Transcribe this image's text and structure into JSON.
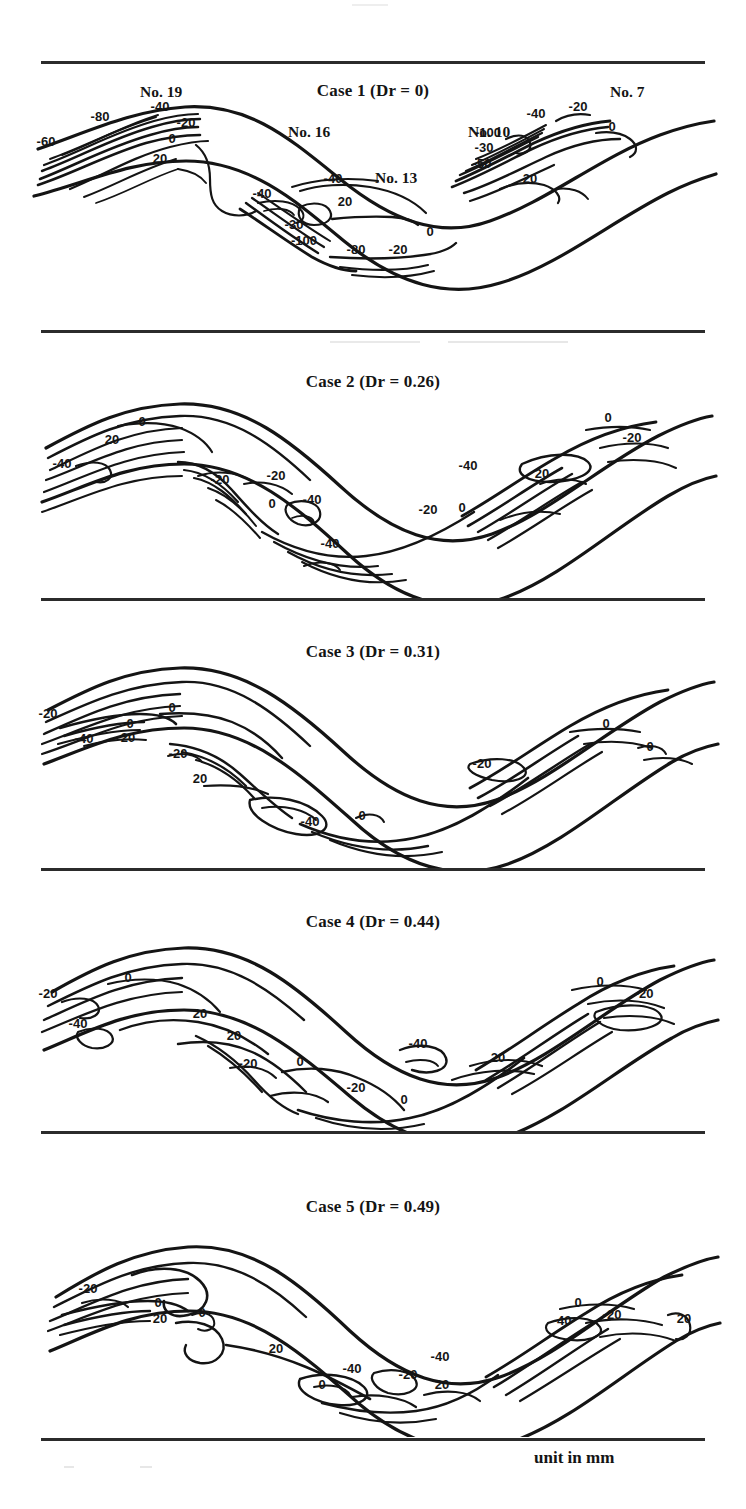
{
  "figure": {
    "units_note": "unit in mm",
    "top_fragment": "",
    "panels": [
      {
        "id": "case-1",
        "title": "Case 1 (Dr = 0)",
        "case_number": 1,
        "dr": "0",
        "gauge_labels": [
          {
            "text": "No. 19",
            "x": 140,
            "y": 22
          },
          {
            "text": "No. 16",
            "x": 288,
            "y": 62
          },
          {
            "text": "No. 13",
            "x": 375,
            "y": 108
          },
          {
            "text": "No. 10",
            "x": 468,
            "y": 62
          },
          {
            "text": "No. 7",
            "x": 610,
            "y": 22
          }
        ],
        "contour_labels": [
          {
            "v": "-80",
            "x": 100,
            "y": 60
          },
          {
            "v": "-60",
            "x": 46,
            "y": 85
          },
          {
            "v": "-40",
            "x": 160,
            "y": 50
          },
          {
            "v": "-20",
            "x": 186,
            "y": 66
          },
          {
            "v": "0",
            "x": 172,
            "y": 82
          },
          {
            "v": "20",
            "x": 160,
            "y": 102
          },
          {
            "v": "-40",
            "x": 262,
            "y": 137
          },
          {
            "v": "-40",
            "x": 333,
            "y": 122
          },
          {
            "v": "20",
            "x": 345,
            "y": 145
          },
          {
            "v": "-30",
            "x": 294,
            "y": 168
          },
          {
            "v": "-100",
            "x": 304,
            "y": 184
          },
          {
            "v": "-80",
            "x": 356,
            "y": 193
          },
          {
            "v": "-20",
            "x": 398,
            "y": 193
          },
          {
            "v": "0",
            "x": 430,
            "y": 175
          },
          {
            "v": "-100",
            "x": 488,
            "y": 76
          },
          {
            "v": "-30",
            "x": 484,
            "y": 91
          },
          {
            "v": "-50",
            "x": 482,
            "y": 107
          },
          {
            "v": "-40",
            "x": 536,
            "y": 57
          },
          {
            "v": "-20",
            "x": 578,
            "y": 50
          },
          {
            "v": "0",
            "x": 612,
            "y": 70
          },
          {
            "v": "20",
            "x": 530,
            "y": 122
          }
        ]
      },
      {
        "id": "case-2",
        "title": "Case 2  (Dr = 0.26)",
        "case_number": 2,
        "dr": "0.26",
        "gauge_labels": [],
        "contour_labels": [
          {
            "v": "0",
            "x": 142,
            "y": 46
          },
          {
            "v": "20",
            "x": 112,
            "y": 64
          },
          {
            "v": "-40",
            "x": 62,
            "y": 88
          },
          {
            "v": "-20",
            "x": 220,
            "y": 104
          },
          {
            "v": "-20",
            "x": 276,
            "y": 100
          },
          {
            "v": "0",
            "x": 272,
            "y": 128
          },
          {
            "v": "-40",
            "x": 312,
            "y": 124
          },
          {
            "v": "-40",
            "x": 330,
            "y": 168
          },
          {
            "v": "-20",
            "x": 428,
            "y": 134
          },
          {
            "v": "0",
            "x": 462,
            "y": 132
          },
          {
            "v": "-40",
            "x": 468,
            "y": 90
          },
          {
            "v": "20",
            "x": 542,
            "y": 98
          },
          {
            "v": "0",
            "x": 608,
            "y": 42
          },
          {
            "v": "-20",
            "x": 632,
            "y": 62
          }
        ]
      },
      {
        "id": "case-3",
        "title": "Case 3  (Dr = 0.31)",
        "case_number": 3,
        "dr": "0.31",
        "gauge_labels": [],
        "contour_labels": [
          {
            "v": "-20",
            "x": 48,
            "y": 70
          },
          {
            "v": "0",
            "x": 172,
            "y": 64
          },
          {
            "v": "0",
            "x": 130,
            "y": 80
          },
          {
            "v": "-40",
            "x": 84,
            "y": 95
          },
          {
            "v": "20",
            "x": 128,
            "y": 94
          },
          {
            "v": "-20",
            "x": 178,
            "y": 110
          },
          {
            "v": "20",
            "x": 200,
            "y": 135
          },
          {
            "v": "-40",
            "x": 310,
            "y": 178
          },
          {
            "v": "0",
            "x": 362,
            "y": 172
          },
          {
            "v": "-20",
            "x": 482,
            "y": 120
          },
          {
            "v": "0",
            "x": 606,
            "y": 80
          },
          {
            "v": "0",
            "x": 650,
            "y": 103
          }
        ]
      },
      {
        "id": "case-4",
        "title": "Case 4  (Dr = 0.44)",
        "case_number": 4,
        "dr": "0.44",
        "gauge_labels": [],
        "contour_labels": [
          {
            "v": "-20",
            "x": 48,
            "y": 78
          },
          {
            "v": "0",
            "x": 128,
            "y": 62
          },
          {
            "v": "-40",
            "x": 78,
            "y": 108
          },
          {
            "v": "20",
            "x": 200,
            "y": 98
          },
          {
            "v": "20",
            "x": 234,
            "y": 120
          },
          {
            "v": "-20",
            "x": 248,
            "y": 148
          },
          {
            "v": "0",
            "x": 300,
            "y": 146
          },
          {
            "v": "-20",
            "x": 356,
            "y": 172
          },
          {
            "v": "0",
            "x": 404,
            "y": 184
          },
          {
            "v": "-40",
            "x": 418,
            "y": 128
          },
          {
            "v": "20",
            "x": 498,
            "y": 142
          },
          {
            "v": "0",
            "x": 600,
            "y": 66
          },
          {
            "v": "-20",
            "x": 644,
            "y": 78
          }
        ]
      },
      {
        "id": "case-5",
        "title": "Case 5  (Dr = 0.49)",
        "case_number": 5,
        "dr": "0.49",
        "gauge_labels": [],
        "contour_labels": [
          {
            "v": "-20",
            "x": 88,
            "y": 82
          },
          {
            "v": "0",
            "x": 158,
            "y": 96
          },
          {
            "v": "20",
            "x": 160,
            "y": 112
          },
          {
            "v": "0",
            "x": 202,
            "y": 106
          },
          {
            "v": "20",
            "x": 276,
            "y": 142
          },
          {
            "v": "-40",
            "x": 352,
            "y": 162
          },
          {
            "v": "0",
            "x": 322,
            "y": 178
          },
          {
            "v": "-20",
            "x": 408,
            "y": 168
          },
          {
            "v": "-40",
            "x": 440,
            "y": 150
          },
          {
            "v": "20",
            "x": 442,
            "y": 178
          },
          {
            "v": "0",
            "x": 578,
            "y": 96
          },
          {
            "v": "-40",
            "x": 562,
            "y": 114
          },
          {
            "v": "-20",
            "x": 612,
            "y": 108
          },
          {
            "v": "20",
            "x": 684,
            "y": 112
          }
        ]
      }
    ],
    "rules_y": [
      61,
      330,
      598,
      868,
      1131,
      1438
    ]
  }
}
